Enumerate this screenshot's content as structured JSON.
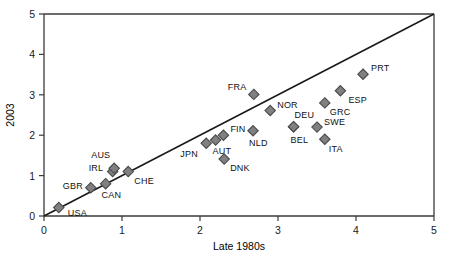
{
  "chart_data": {
    "type": "scatter",
    "title": "",
    "xlabel": "Late 1980s",
    "ylabel": "2003",
    "xlim": [
      0,
      5
    ],
    "ylim": [
      0,
      5
    ],
    "xticks": [
      "0",
      "1",
      "2",
      "3",
      "4",
      "5"
    ],
    "yticks": [
      "0",
      "1",
      "2",
      "3",
      "4",
      "5"
    ],
    "grid": false,
    "legend": "none",
    "marker_color": "#808080",
    "marker_edge_color": "#4a4a4a",
    "marker_shape": "diamond",
    "reference_line": {
      "label": "45-degree line",
      "from": [
        0,
        0
      ],
      "to": [
        5,
        5
      ],
      "color": "#1a1a1a"
    },
    "points": [
      {
        "label": "USA",
        "x": 0.19,
        "y": 0.21,
        "label_dx": 9,
        "label_dy": 8
      },
      {
        "label": "GBR",
        "x": 0.6,
        "y": 0.7,
        "label_dx": -28,
        "label_dy": 1
      },
      {
        "label": "CAN",
        "x": 0.79,
        "y": 0.8,
        "label_dx": -4,
        "label_dy": 14
      },
      {
        "label": "IRL",
        "x": 0.88,
        "y": 1.1,
        "label_dx": -24,
        "label_dy": -1
      },
      {
        "label": "AUS",
        "x": 0.9,
        "y": 1.18,
        "label_dx": -23,
        "label_dy": -10
      },
      {
        "label": "CHE",
        "x": 1.08,
        "y": 1.1,
        "label_dx": 6,
        "label_dy": 12
      },
      {
        "label": "JPN",
        "x": 2.08,
        "y": 1.8,
        "label_dx": -26,
        "label_dy": 14
      },
      {
        "label": "AUT",
        "x": 2.2,
        "y": 1.88,
        "label_dx": -3,
        "label_dy": 14
      },
      {
        "label": "FIN",
        "x": 2.3,
        "y": 2.0,
        "label_dx": 7,
        "label_dy": -3
      },
      {
        "label": "DNK",
        "x": 2.31,
        "y": 1.41,
        "label_dx": 6,
        "label_dy": 12
      },
      {
        "label": "NLD",
        "x": 2.68,
        "y": 2.11,
        "label_dx": -4,
        "label_dy": 15
      },
      {
        "label": "FRA",
        "x": 2.69,
        "y": 3.01,
        "label_dx": -26,
        "label_dy": -4
      },
      {
        "label": "NOR",
        "x": 2.9,
        "y": 2.61,
        "label_dx": 7,
        "label_dy": -3
      },
      {
        "label": "DEU",
        "x": 3.2,
        "y": 2.21,
        "label_dx": 1,
        "label_dy": -9
      },
      {
        "label": "BEL",
        "x": 3.2,
        "y": 2.21,
        "label_dx": -3,
        "label_dy": 16
      },
      {
        "label": "SWE",
        "x": 3.5,
        "y": 2.2,
        "label_dx": 7,
        "label_dy": -2
      },
      {
        "label": "ITA",
        "x": 3.6,
        "y": 1.9,
        "label_dx": 4,
        "label_dy": 13
      },
      {
        "label": "GRC",
        "x": 3.6,
        "y": 2.8,
        "label_dx": 5,
        "label_dy": 12
      },
      {
        "label": "ESP",
        "x": 3.8,
        "y": 3.1,
        "label_dx": 8,
        "label_dy": 12
      },
      {
        "label": "PRT",
        "x": 4.09,
        "y": 3.51,
        "label_dx": 8,
        "label_dy": -3
      }
    ]
  }
}
